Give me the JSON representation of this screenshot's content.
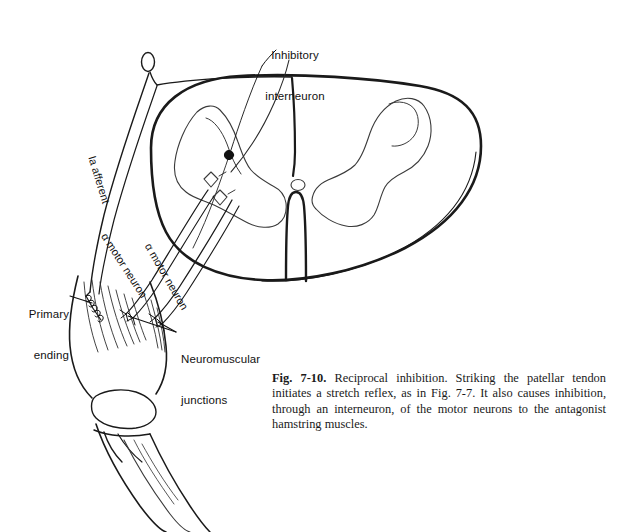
{
  "figure": {
    "number": "Fig. 7-10.",
    "title": "Reciprocal inhibition.",
    "caption_body": " Striking the patellar tendon initiates a stretch reflex, as in Fig. 7-7. It also causes inhibition, through an interneuron, of the motor neurons to the antagonist hamstring muscles.",
    "caption_full": "Fig. 7-10. Reciprocal inhibition. Striking the patellar tendon initiates a stretch reflex, as in Fig. 7-7. It also causes inhibition, through an interneuron, of the motor neurons to the antagonist hamstring muscles."
  },
  "labels": {
    "inhibitory_interneuron_line1": "Inhibitory",
    "inhibitory_interneuron_line2": "interneuron",
    "ia_afferent": "Ia afferent",
    "alpha_motor_neuron_1": "α motor neuron",
    "alpha_motor_neuron_2": "α motor neuron",
    "primary_ending_line1": "Primary",
    "primary_ending_line2": "ending",
    "neuromuscular_junctions_line1": "Neuromuscular",
    "neuromuscular_junctions_line2": "junctions"
  },
  "anatomy": {
    "spinal_cord": "spinal-cord-cross-section",
    "gray_matter": "butterfly-gray-matter",
    "dorsal_root_ganglion": "dorsal-root-ganglion",
    "ventral_median_fissure": "ventral-median-fissure",
    "interneuron_soma": "inhibitory-interneuron-cell-body",
    "synapse_markers": 2,
    "leg": "leg-with-quadriceps-and-hamstring",
    "muscle_spindle": "muscle-spindle-annulospiral-ending",
    "knee": "knee-joint"
  },
  "colors": {
    "ink": "#111111",
    "line": "#1a1a1a",
    "fine_line": "#3a3a3a",
    "background": "#ffffff"
  }
}
